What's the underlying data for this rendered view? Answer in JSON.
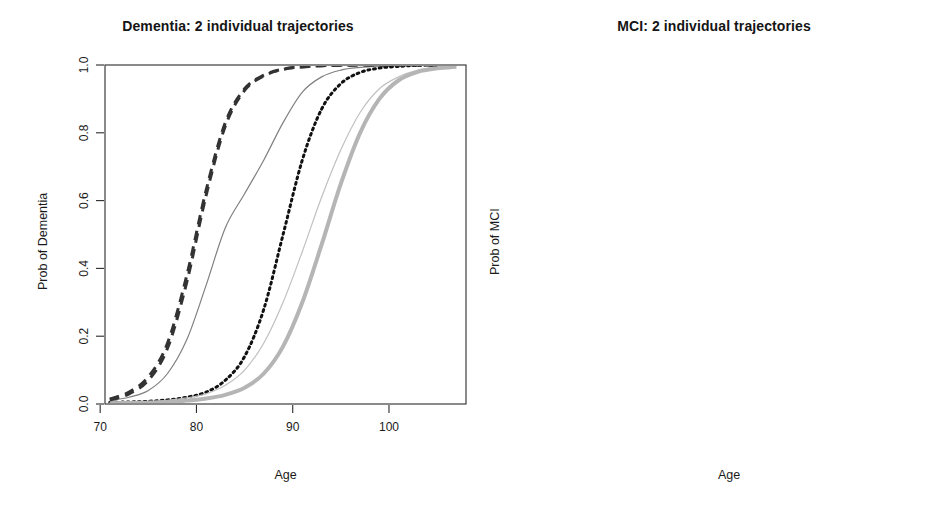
{
  "figure": {
    "background": "#ffffff",
    "axis_color": "#2b2b2b"
  },
  "panels": [
    {
      "id": "dementia",
      "title": "Dementia: 2 individual trajectories",
      "xlabel": "Age",
      "ylabel": "Prob of Dementia"
    },
    {
      "id": "mci",
      "title": "MCI: 2 individual trajectories",
      "xlabel": "Age",
      "ylabel": "Prob of MCI"
    }
  ],
  "legend": {
    "position": "top-left",
    "entries": [
      {
        "label": "k=1",
        "style": "solid",
        "color": "#b3b3b3"
      },
      {
        "label": "k=2",
        "style": "dashed",
        "color": "#333333"
      },
      {
        "label": "k=3",
        "style": "dotted",
        "color": "#111111"
      }
    ]
  },
  "axis_ticks": {
    "x": [
      "70",
      "80",
      "90",
      "100"
    ],
    "x_values": [
      70,
      80,
      90,
      100
    ],
    "y": [
      "0.0",
      "0.2",
      "0.4",
      "0.6",
      "0.8",
      "1.0"
    ],
    "y_values": [
      0.0,
      0.2,
      0.4,
      0.6,
      0.8,
      1.0
    ]
  },
  "chart_data": [
    {
      "type": "line",
      "title": "Dementia: 2 individual trajectories",
      "xlabel": "Age",
      "ylabel": "Prob of Dementia",
      "xlim": [
        70.5,
        108
      ],
      "ylim": [
        0.0,
        1.0
      ],
      "grid": false,
      "legend": [
        "k=1",
        "k=2",
        "k=3"
      ],
      "legend_position": "top-left",
      "x": [
        71,
        73,
        75,
        77,
        79,
        81,
        83,
        85,
        87,
        89,
        91,
        93,
        95,
        97,
        99,
        101,
        103,
        105,
        107
      ],
      "series": [
        {
          "name": "individual 1, k=1",
          "style": "solid",
          "color": "#808080",
          "width": 1.2,
          "values": [
            0.01,
            0.02,
            0.04,
            0.09,
            0.19,
            0.35,
            0.52,
            0.62,
            0.72,
            0.83,
            0.92,
            0.965,
            0.985,
            0.993,
            0.997,
            0.999,
            1.0,
            1.0,
            1.0
          ]
        },
        {
          "name": "individual 1, k=2",
          "style": "dashed",
          "color": "#333333",
          "width": 3.0,
          "values": [
            0.015,
            0.035,
            0.08,
            0.18,
            0.38,
            0.63,
            0.83,
            0.93,
            0.97,
            0.988,
            0.995,
            0.998,
            0.999,
            1.0,
            1.0,
            1.0,
            1.0,
            1.0,
            1.0
          ]
        },
        {
          "name": "individual 1, k=3",
          "style": "dotted",
          "color": "#111111",
          "width": 3.0,
          "values": [
            0.005,
            0.006,
            0.008,
            0.012,
            0.02,
            0.035,
            0.07,
            0.14,
            0.28,
            0.5,
            0.72,
            0.87,
            0.945,
            0.978,
            0.991,
            0.996,
            0.999,
            1.0,
            1.0
          ]
        },
        {
          "name": "individual 2, k=1",
          "style": "solid",
          "color": "#c0c0c0",
          "width": 1.2,
          "values": [
            0.004,
            0.005,
            0.007,
            0.011,
            0.018,
            0.03,
            0.055,
            0.1,
            0.18,
            0.3,
            0.45,
            0.61,
            0.75,
            0.86,
            0.93,
            0.965,
            0.985,
            0.993,
            0.997
          ]
        },
        {
          "name": "individual 2, k=2",
          "style": "dashed",
          "color": "#333333",
          "width": 3.0,
          "values": [
            0.012,
            0.03,
            0.07,
            0.165,
            0.36,
            0.615,
            0.82,
            0.925,
            0.968,
            0.987,
            0.994,
            0.998,
            0.999,
            1.0,
            1.0,
            1.0,
            1.0,
            1.0,
            1.0
          ]
        },
        {
          "name": "individual 2, k=3",
          "style": "solid-thick",
          "color": "#b5b5b5",
          "width": 4.0,
          "values": [
            0.002,
            0.003,
            0.004,
            0.006,
            0.01,
            0.016,
            0.027,
            0.048,
            0.09,
            0.17,
            0.3,
            0.47,
            0.65,
            0.8,
            0.9,
            0.955,
            0.98,
            0.99,
            0.995
          ]
        }
      ]
    },
    {
      "type": "line",
      "title": "MCI: 2 individual trajectories",
      "xlabel": "Age",
      "ylabel": "Prob of MCI",
      "xlim": [
        70.5,
        108
      ],
      "ylim": [
        0.0,
        1.0
      ],
      "grid": false,
      "x": [
        71,
        73,
        75,
        77,
        79,
        81,
        83,
        85,
        87,
        89,
        91,
        93,
        95,
        97,
        99,
        101,
        103,
        105,
        107
      ],
      "series": [
        {
          "name": "individual 1, k=1",
          "style": "solid",
          "color": "#808080",
          "width": 1.2,
          "values": [
            0.03,
            0.09,
            0.18,
            0.26,
            0.3,
            0.312,
            0.312,
            0.31,
            0.3,
            0.27,
            0.22,
            0.16,
            0.11,
            0.07,
            0.042,
            0.025,
            0.015,
            0.009,
            0.005
          ]
        },
        {
          "name": "individual 1, k=2",
          "style": "dashed",
          "color": "#333333",
          "width": 3.0,
          "values": [
            0.045,
            0.15,
            0.29,
            0.37,
            0.4,
            0.345,
            0.25,
            0.16,
            0.095,
            0.055,
            0.033,
            0.022,
            0.016,
            0.014,
            0.013,
            0.012,
            0.012,
            0.012,
            0.012
          ]
        },
        {
          "name": "individual 1, k=3",
          "style": "dotted",
          "color": "#111111",
          "width": 3.0,
          "values": [
            0.012,
            0.02,
            0.035,
            0.075,
            0.16,
            0.3,
            0.5,
            0.7,
            0.78,
            0.69,
            0.48,
            0.29,
            0.16,
            0.085,
            0.045,
            0.025,
            0.015,
            0.01,
            0.008
          ]
        },
        {
          "name": "individual 2, k=1",
          "style": "solid",
          "color": "#c9c9c9",
          "width": 1.2,
          "values": [
            0.008,
            0.012,
            0.022,
            0.045,
            0.09,
            0.165,
            0.26,
            0.33,
            0.355,
            0.34,
            0.3,
            0.262,
            0.245,
            0.23,
            0.2,
            0.15,
            0.095,
            0.05,
            0.022
          ]
        },
        {
          "name": "individual 2, k=2",
          "style": "dashed",
          "color": "#333333",
          "width": 3.0,
          "values": [
            0.04,
            0.14,
            0.275,
            0.36,
            0.392,
            0.34,
            0.245,
            0.155,
            0.092,
            0.052,
            0.03,
            0.02,
            0.015,
            0.013,
            0.012,
            0.012,
            0.012,
            0.012,
            0.012
          ]
        },
        {
          "name": "individual 2, k=3",
          "style": "solid-thick",
          "color": "#b5b5b5",
          "width": 4.0,
          "values": [
            0.006,
            0.006,
            0.007,
            0.008,
            0.01,
            0.014,
            0.025,
            0.055,
            0.11,
            0.2,
            0.3,
            0.39,
            0.42,
            0.38,
            0.29,
            0.19,
            0.11,
            0.06,
            0.03
          ]
        }
      ]
    }
  ]
}
